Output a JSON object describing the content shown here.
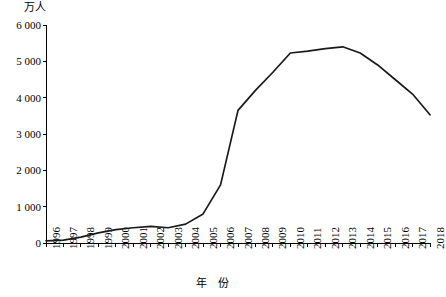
{
  "chart_data": {
    "type": "line",
    "title": "",
    "ylabel": "万人",
    "xlabel": "年  份",
    "ylim": [
      0,
      6000
    ],
    "ytick_values": [
      0,
      1000,
      2000,
      3000,
      4000,
      5000,
      6000
    ],
    "ytick_labels": [
      "0",
      "1 000",
      "2 000",
      "3 000",
      "4 000",
      "5 000",
      "6 000"
    ],
    "grid": false,
    "legend": "none",
    "line_color": "#1a1a1a",
    "categories": [
      "1996",
      "1997",
      "1998",
      "1999",
      "2000",
      "2001",
      "2002",
      "2003",
      "2004",
      "2005",
      "2006",
      "2007",
      "2008",
      "2009",
      "2010",
      "2011",
      "2012",
      "2013",
      "2014",
      "2015",
      "2016",
      "2017",
      "2018"
    ],
    "series": [
      {
        "name": "人数",
        "values": [
          60,
          80,
          160,
          280,
          370,
          420,
          460,
          420,
          520,
          800,
          1600,
          3650,
          4200,
          4700,
          5230,
          5280,
          5350,
          5400,
          5230,
          4900,
          4500,
          4100,
          3530
        ]
      }
    ],
    "axis_geometry": {
      "plot_left": 46,
      "plot_right": 430,
      "plot_top": 25,
      "plot_bottom": 243
    }
  }
}
